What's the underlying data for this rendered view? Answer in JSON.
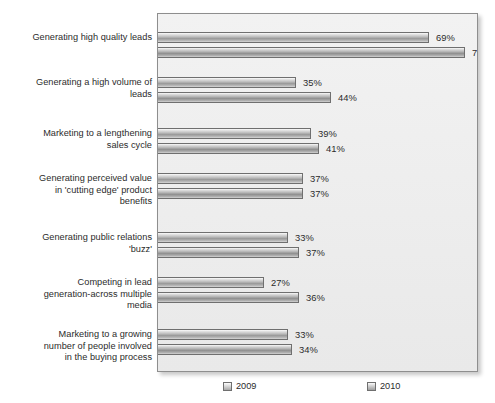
{
  "chart_data": {
    "type": "bar",
    "orientation": "horizontal",
    "title": "",
    "xlabel": "",
    "ylabel": "",
    "grid": false,
    "legend_position": "bottom",
    "xlim": [
      0,
      80
    ],
    "value_suffix": "%",
    "categories": [
      "Generating high quality leads",
      "Generating a high volume of\nleads",
      "Marketing to a lengthening\nsales cycle",
      "Generating perceived value\nin 'cutting edge' product\nbenefits",
      "Generating public relations\n'buzz'",
      "Competing in lead\ngeneration-across multiple\nmedia",
      "Marketing to a growing\nnumber of people involved\nin the buying process"
    ],
    "series": [
      {
        "name": "2009",
        "color": "#b4b4b4",
        "values": [
          69,
          35,
          39,
          37,
          33,
          27,
          33
        ],
        "labels": [
          "69%",
          "35%",
          "39%",
          "37%",
          "33%",
          "27%",
          "33%"
        ]
      },
      {
        "name": "2010",
        "color": "#a0a0a0",
        "values": [
          78,
          44,
          41,
          37,
          36,
          36,
          34
        ],
        "labels": [
          "78%",
          "44%",
          "41%",
          "37%",
          "37%",
          "36%",
          "34%"
        ]
      }
    ]
  },
  "legend": {
    "items": [
      {
        "label": "2009"
      },
      {
        "label": "2010"
      }
    ]
  }
}
